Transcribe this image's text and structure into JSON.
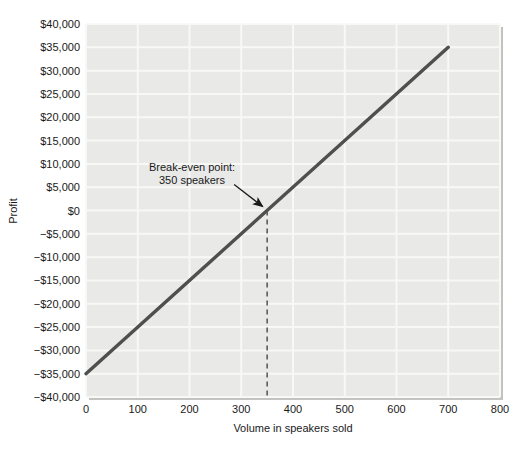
{
  "chart_data": {
    "type": "line",
    "title": "",
    "xlabel": "Volume in speakers sold",
    "ylabel": "Profit",
    "xlim": [
      0,
      800
    ],
    "ylim": [
      -40000,
      40000
    ],
    "grid": true,
    "legend": "none",
    "x_ticks": [
      {
        "v": 0,
        "label": "0"
      },
      {
        "v": 100,
        "label": "100"
      },
      {
        "v": 200,
        "label": "200"
      },
      {
        "v": 300,
        "label": "300"
      },
      {
        "v": 400,
        "label": "400"
      },
      {
        "v": 500,
        "label": "500"
      },
      {
        "v": 600,
        "label": "600"
      },
      {
        "v": 700,
        "label": "700"
      },
      {
        "v": 800,
        "label": "800"
      }
    ],
    "y_ticks": [
      {
        "v": 40000,
        "label": "$40,000"
      },
      {
        "v": 35000,
        "label": "$35,000"
      },
      {
        "v": 30000,
        "label": "$30,000"
      },
      {
        "v": 25000,
        "label": "$25,000"
      },
      {
        "v": 20000,
        "label": "$20,000"
      },
      {
        "v": 15000,
        "label": "$15,000"
      },
      {
        "v": 10000,
        "label": "$10,000"
      },
      {
        "v": 5000,
        "label": "$5,000"
      },
      {
        "v": 0,
        "label": "$0"
      },
      {
        "v": -5000,
        "label": "−$5,000"
      },
      {
        "v": -10000,
        "label": "−$10,000"
      },
      {
        "v": -15000,
        "label": "−$15,000"
      },
      {
        "v": -20000,
        "label": "−$20,000"
      },
      {
        "v": -25000,
        "label": "−$25,000"
      },
      {
        "v": -30000,
        "label": "−$30,000"
      },
      {
        "v": -35000,
        "label": "−$35,000"
      },
      {
        "v": -40000,
        "label": "−$40,000"
      }
    ],
    "series": [
      {
        "name": "profit-line",
        "color": "#4f4f4f",
        "points": [
          {
            "x": 0,
            "y": -35000
          },
          {
            "x": 700,
            "y": 35000
          }
        ]
      }
    ],
    "break_even": {
      "x": 350,
      "y": 0,
      "dashed_line_to_x_axis": true
    },
    "annotation": {
      "line1": "Break-even point:",
      "line2": "350 speakers"
    },
    "colors": {
      "plot_bg": "#e9e9e8",
      "gridline": "#f8f8f6",
      "shadow": "#c3c3c2",
      "dashed": "#3c3c3c",
      "arrow": "#1a1a1a",
      "text": "#1a1a1a"
    }
  }
}
